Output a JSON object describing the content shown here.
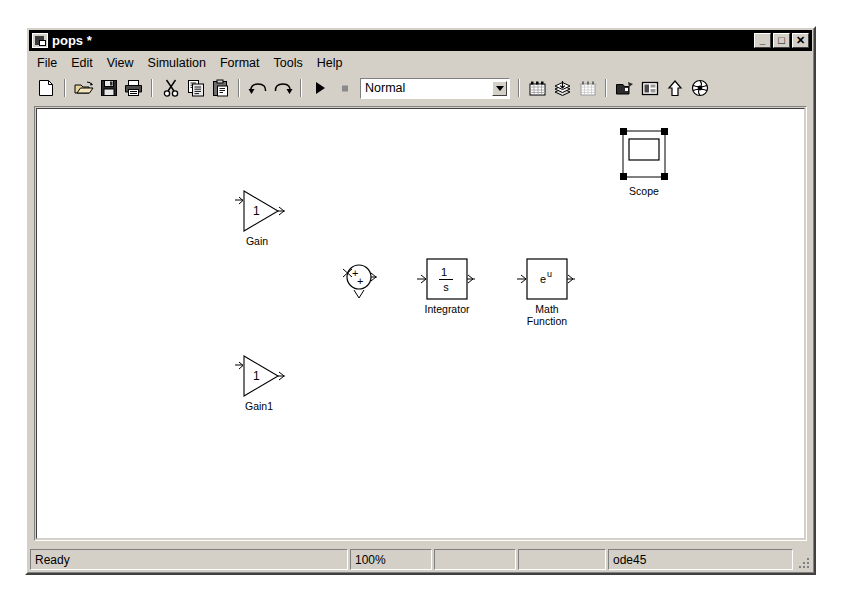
{
  "window": {
    "title": "pops *",
    "icon": "simulink-model-icon",
    "controls": [
      {
        "name": "minimize-button",
        "glyph": "_"
      },
      {
        "name": "maximize-button",
        "glyph": "□"
      },
      {
        "name": "close-button",
        "glyph": "✕"
      }
    ]
  },
  "menubar": {
    "items": [
      {
        "label": "File"
      },
      {
        "label": "Edit"
      },
      {
        "label": "View"
      },
      {
        "label": "Simulation"
      },
      {
        "label": "Format"
      },
      {
        "label": "Tools"
      },
      {
        "label": "Help"
      }
    ]
  },
  "toolbar": {
    "buttons": [
      {
        "name": "new-model-icon",
        "tip": "New model"
      },
      {
        "name": "open-model-icon",
        "tip": "Open model"
      },
      {
        "name": "save-icon",
        "tip": "Save"
      },
      {
        "name": "print-icon",
        "tip": "Print"
      },
      {
        "name": "cut-icon",
        "tip": "Cut"
      },
      {
        "name": "copy-icon",
        "tip": "Copy"
      },
      {
        "name": "paste-icon",
        "tip": "Paste"
      },
      {
        "name": "undo-icon",
        "tip": "Undo"
      },
      {
        "name": "redo-icon",
        "tip": "Redo"
      },
      {
        "name": "start-simulation-icon",
        "tip": "Start simulation"
      },
      {
        "name": "stop-simulation-icon",
        "tip": "Stop simulation"
      },
      {
        "name": "update-diagram-icon",
        "tip": "Update diagram"
      },
      {
        "name": "library-browser-icon",
        "tip": "Library Browser"
      },
      {
        "name": "model-explorer-icon",
        "tip": "Model Explorer"
      },
      {
        "name": "debug-icon",
        "tip": "Debug"
      },
      {
        "name": "model-browser-icon",
        "tip": "Model browser"
      },
      {
        "name": "go-to-parent-icon",
        "tip": "Go to parent system"
      },
      {
        "name": "help-icon",
        "tip": "Simulink help"
      }
    ],
    "simulation_mode": {
      "value": "Normal",
      "options": [
        "Normal",
        "Accelerator",
        "External"
      ]
    }
  },
  "canvas": {
    "blocks": [
      {
        "name": "gain-block",
        "label": "Gain",
        "type": "gain",
        "value": "1",
        "selected": false,
        "x": 196,
        "y": 80,
        "w": 52,
        "h": 48
      },
      {
        "name": "sum-block",
        "label": "",
        "type": "sum",
        "signs": [
          "+",
          "+"
        ],
        "selected": false,
        "x": 303,
        "y": 152,
        "w": 32,
        "h": 32
      },
      {
        "name": "integrator-block",
        "label": "Integrator",
        "type": "integrator",
        "numerator": "1",
        "denominator": "s",
        "selected": false,
        "x": 385,
        "y": 150,
        "w": 40,
        "h": 40
      },
      {
        "name": "math-function-block",
        "label": "Math\nFunction",
        "type": "math-function",
        "expression_base": "e",
        "expression_exponent": "u",
        "selected": false,
        "x": 485,
        "y": 150,
        "w": 40,
        "h": 40
      },
      {
        "name": "gain1-block",
        "label": "Gain1",
        "type": "gain",
        "value": "1",
        "selected": false,
        "x": 196,
        "y": 245,
        "w": 52,
        "h": 48
      },
      {
        "name": "scope-block",
        "label": "Scope",
        "type": "scope",
        "selected": true,
        "x": 581,
        "y": 18,
        "w": 48,
        "h": 52
      }
    ]
  },
  "statusbar": {
    "message": "Ready",
    "zoom": "100%",
    "panel3": "",
    "panel4": "",
    "solver": "ode45"
  }
}
